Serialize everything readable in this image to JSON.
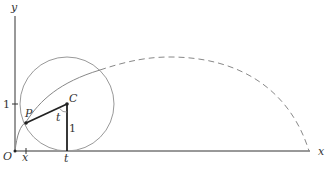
{
  "diagram": {
    "type": "cycloid-construction",
    "labels": {
      "y_axis": "y",
      "x_axis": "x",
      "origin": "O",
      "x_tick": "x",
      "t_tick": "t",
      "y_tick_one": "1",
      "point_p": "P",
      "point_c": "C",
      "angle": "t",
      "radius": "1"
    },
    "colors": {
      "axis": "#333333",
      "circle": "#999999",
      "curve": "#888888",
      "segment": "#222222"
    }
  }
}
